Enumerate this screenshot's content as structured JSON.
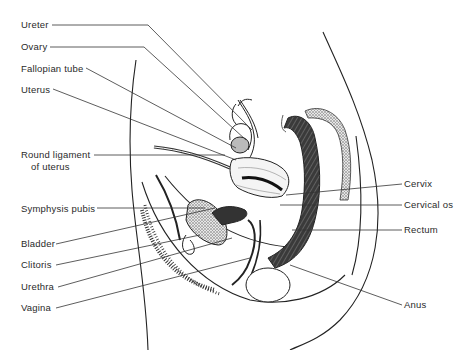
{
  "diagram": {
    "left_labels": [
      {
        "id": "ureter",
        "text": "Ureter",
        "x": 21,
        "y": 19
      },
      {
        "id": "ovary",
        "text": "Ovary",
        "x": 21,
        "y": 41
      },
      {
        "id": "fallopian-tube",
        "text": "Fallopian tube",
        "x": 21,
        "y": 63
      },
      {
        "id": "uterus",
        "text": "Uterus",
        "x": 21,
        "y": 84
      },
      {
        "id": "round-ligament",
        "text": "Round ligament",
        "x": 21,
        "y": 149
      },
      {
        "id": "round-ligament-2",
        "text": "of uterus",
        "x": 31,
        "y": 161
      },
      {
        "id": "symphysis-pubis",
        "text": "Symphysis pubis",
        "x": 21,
        "y": 203
      },
      {
        "id": "bladder",
        "text": "Bladder",
        "x": 21,
        "y": 238
      },
      {
        "id": "clitoris",
        "text": "Clitoris",
        "x": 21,
        "y": 259
      },
      {
        "id": "urethra",
        "text": "Urethra",
        "x": 21,
        "y": 281
      },
      {
        "id": "vagina",
        "text": "Vagina",
        "x": 21,
        "y": 302
      }
    ],
    "right_labels": [
      {
        "id": "cervix",
        "text": "Cervix",
        "x": 404,
        "y": 178
      },
      {
        "id": "cervical-os",
        "text": "Cervical os",
        "x": 404,
        "y": 199
      },
      {
        "id": "rectum",
        "text": "Rectum",
        "x": 404,
        "y": 224
      },
      {
        "id": "anus",
        "text": "Anus",
        "x": 404,
        "y": 299
      }
    ]
  }
}
